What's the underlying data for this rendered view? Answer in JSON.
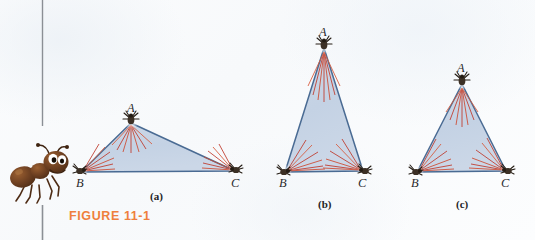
{
  "figure": {
    "caption": "FIGURE 11-1",
    "caption_color": "#ef7f3d",
    "background_color": "#fafcfd",
    "divider_color": "#8b8f95"
  },
  "illustration": {
    "ant": {
      "name": "cartoon-ant",
      "body_color": "#6b3f21",
      "body_highlight": "#8a5329",
      "leg_color": "#5a3219",
      "eye_color": "#ffffff",
      "pupil_color": "#1a1008"
    }
  },
  "palette": {
    "triangle_fill": "#c6d4e6",
    "triangle_edge": "#4a6b93",
    "ray_red": "#c0392b",
    "ray_orange": "#d9593a",
    "tick_body": "#4a3c30",
    "tick_dark": "#241c14"
  },
  "diagrams": [
    {
      "id": "a",
      "sublabel": "(a)",
      "sublabel_x": 150,
      "sublabel_y": 191,
      "vertices": [
        {
          "label": "A",
          "x": 131,
          "y": 123,
          "label_x": 127,
          "label_y": 102
        },
        {
          "label": "B",
          "x": 81,
          "y": 172,
          "label_x": 76,
          "label_y": 177
        },
        {
          "label": "C",
          "x": 235,
          "y": 171,
          "label_x": 231,
          "label_y": 177
        }
      ]
    },
    {
      "id": "b",
      "sublabel": "(b)",
      "sublabel_x": 318,
      "sublabel_y": 199,
      "vertices": [
        {
          "label": "A",
          "x": 324,
          "y": 48,
          "label_x": 319,
          "label_y": 26
        },
        {
          "label": "B",
          "x": 285,
          "y": 172,
          "label_x": 279,
          "label_y": 177
        },
        {
          "label": "C",
          "x": 363,
          "y": 171,
          "label_x": 358,
          "label_y": 177
        }
      ]
    },
    {
      "id": "c",
      "sublabel": "(c)",
      "sublabel_x": 456,
      "sublabel_y": 199,
      "vertices": [
        {
          "label": "A",
          "x": 462,
          "y": 84,
          "label_x": 457,
          "label_y": 62
        },
        {
          "label": "B",
          "x": 417,
          "y": 172,
          "label_x": 411,
          "label_y": 177
        },
        {
          "label": "C",
          "x": 506,
          "y": 171,
          "label_x": 501,
          "label_y": 177
        }
      ]
    }
  ]
}
